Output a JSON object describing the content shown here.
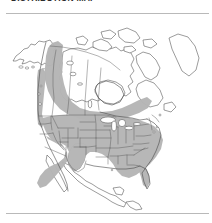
{
  "figure": {
    "caption_clipped": "DISTRIBUTION MAP",
    "alt_description": "Outline map of North America with a shaded distribution range",
    "divider_top": "horizontal-rule",
    "divider_bottom": "horizontal-rule"
  },
  "map": {
    "title": "North America distribution range",
    "projection": "conic",
    "background_color": "#ffffff",
    "shaded_fill_color": "#b5b5b5",
    "unshaded_fill_color": "#ffffff",
    "outline_color": "#4a4a4a",
    "state_border_color": "#585858",
    "rule_color": "#b9b9b9",
    "legend": {
      "shaded_meaning": "within range",
      "unshaded_meaning": "outside range"
    },
    "regions_shaded": [
      "Washington",
      "Oregon",
      "California",
      "Idaho",
      "Nevada",
      "Utah",
      "Arizona",
      "Montana",
      "Wyoming",
      "Colorado",
      "New Mexico",
      "North Dakota",
      "South Dakota",
      "Nebraska",
      "Kansas",
      "Oklahoma",
      "Minnesota",
      "Iowa",
      "Missouri",
      "Arkansas",
      "Louisiana",
      "Wisconsin",
      "Illinois",
      "Michigan",
      "Indiana",
      "Ohio",
      "Kentucky",
      "Tennessee",
      "Mississippi",
      "Alabama",
      "Georgia",
      "Florida",
      "South Carolina",
      "North Carolina",
      "Virginia",
      "West Virginia",
      "Maryland",
      "Delaware",
      "Pennsylvania",
      "New Jersey",
      "New York",
      "Connecticut",
      "Rhode Island",
      "Massachusetts",
      "Vermont",
      "New Hampshire",
      "Maine",
      "British Columbia",
      "Alberta",
      "Saskatchewan",
      "Manitoba",
      "Ontario",
      "Quebec (southern)",
      "Yukon (southern)"
    ],
    "regions_unshaded": [
      "Alaska",
      "Northwest Territories",
      "Nunavut",
      "Arctic Archipelago",
      "Newfoundland and Labrador",
      "Texas",
      "Mexico",
      "Baja California",
      "Central America",
      "Greenland (partial)"
    ]
  }
}
